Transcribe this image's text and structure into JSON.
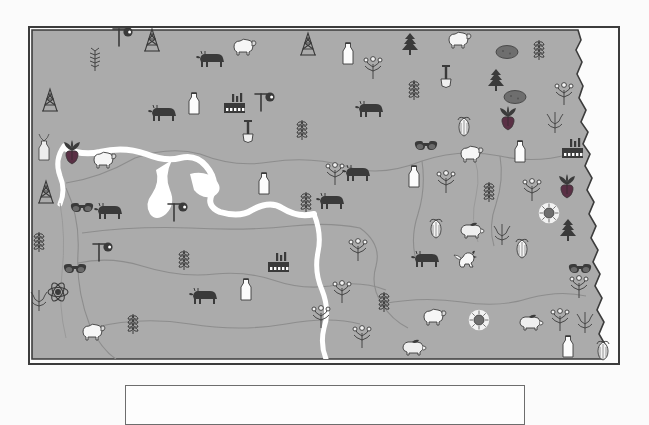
{
  "page": {
    "type": "thematic-pictorial-map",
    "state": "North Dakota"
  },
  "colors": {
    "map_fill": "#ababab",
    "map_border": "#3c3c3c",
    "water": "#ffffff",
    "county_line": "#8d8d8d",
    "legend_border": "#6d6d6d",
    "page_background": "#fbfbfb",
    "icon_dark": "#3a3a3a",
    "icon_mid": "#6e6e6e",
    "icon_light": "#f2f2f2",
    "beet_purple": "#5a3045",
    "sunflower_gold": "#7a7a7a"
  },
  "map": {
    "frame": {
      "x": 28,
      "y": 26,
      "width": 592,
      "height": 339
    },
    "features": [
      {
        "name": "missouri-river",
        "kind": "river",
        "color": "#ffffff"
      },
      {
        "name": "lake-sakakawea",
        "kind": "lake",
        "color": "#ffffff"
      },
      {
        "name": "red-river-border",
        "kind": "river-border",
        "color": "#3c3c3c"
      },
      {
        "name": "county-lines",
        "kind": "boundary",
        "color": "#8d8d8d"
      }
    ]
  },
  "legend": {
    "visible": true,
    "clipped_by_viewport": true,
    "box": {
      "x": 125,
      "y": 385,
      "width": 400,
      "height": 40
    },
    "entries": []
  },
  "symbol_types": [
    {
      "key": "wheat",
      "label": "Wheat",
      "icon": "wheat-icon"
    },
    {
      "key": "cattle",
      "label": "Beef Cattle",
      "icon": "cattle-icon"
    },
    {
      "key": "sheep",
      "label": "Sheep",
      "icon": "sheep-icon"
    },
    {
      "key": "hog",
      "label": "Hogs",
      "icon": "hog-icon"
    },
    {
      "key": "chicken",
      "label": "Poultry",
      "icon": "chicken-icon"
    },
    {
      "key": "milk",
      "label": "Dairy",
      "icon": "milk-bottle-icon"
    },
    {
      "key": "sunflower",
      "label": "Sunflowers",
      "icon": "sunflower-icon"
    },
    {
      "key": "sugarbeet",
      "label": "Sugar Beets",
      "icon": "sugar-beet-icon"
    },
    {
      "key": "potato",
      "label": "Potatoes",
      "icon": "potato-icon"
    },
    {
      "key": "corn",
      "label": "Corn",
      "icon": "corn-icon"
    },
    {
      "key": "barley",
      "label": "Barley",
      "icon": "barley-icon"
    },
    {
      "key": "flax",
      "label": "Flax",
      "icon": "flax-icon"
    },
    {
      "key": "canola",
      "label": "Canola",
      "icon": "canola-icon"
    },
    {
      "key": "conifer",
      "label": "Forestry",
      "icon": "conifer-icon"
    },
    {
      "key": "oilderrick",
      "label": "Petroleum",
      "icon": "oil-derrick-icon"
    },
    {
      "key": "oilpump",
      "label": "Oil Pump",
      "icon": "oil-pump-icon"
    },
    {
      "key": "coal",
      "label": "Lignite Coal",
      "icon": "coal-icon"
    },
    {
      "key": "factory",
      "label": "Manufacturing",
      "icon": "factory-icon"
    },
    {
      "key": "atom",
      "label": "Power Plant",
      "icon": "atom-icon"
    },
    {
      "key": "shovel",
      "label": "Mining",
      "icon": "shovel-icon"
    }
  ],
  "symbols": [
    {
      "t": "oilpump",
      "x": 120,
      "y": 35
    },
    {
      "t": "oilderrick",
      "x": 150,
      "y": 38
    },
    {
      "t": "barley",
      "x": 93,
      "y": 58
    },
    {
      "t": "cattle",
      "x": 210,
      "y": 58
    },
    {
      "t": "sheep",
      "x": 243,
      "y": 45
    },
    {
      "t": "oilderrick",
      "x": 306,
      "y": 42
    },
    {
      "t": "milk",
      "x": 346,
      "y": 52
    },
    {
      "t": "canola",
      "x": 371,
      "y": 66
    },
    {
      "t": "conifer",
      "x": 408,
      "y": 42
    },
    {
      "t": "sheep",
      "x": 458,
      "y": 38
    },
    {
      "t": "potato",
      "x": 505,
      "y": 50
    },
    {
      "t": "wheat",
      "x": 537,
      "y": 48
    },
    {
      "t": "oilderrick",
      "x": 48,
      "y": 98
    },
    {
      "t": "milk",
      "x": 192,
      "y": 102
    },
    {
      "t": "factory",
      "x": 234,
      "y": 103
    },
    {
      "t": "oilpump",
      "x": 262,
      "y": 100
    },
    {
      "t": "cattle",
      "x": 162,
      "y": 112
    },
    {
      "t": "shovel",
      "x": 246,
      "y": 130
    },
    {
      "t": "shovel",
      "x": 444,
      "y": 75
    },
    {
      "t": "conifer",
      "x": 494,
      "y": 78
    },
    {
      "t": "potato",
      "x": 513,
      "y": 95
    },
    {
      "t": "sugarbeet",
      "x": 506,
      "y": 112
    },
    {
      "t": "wheat",
      "x": 412,
      "y": 88
    },
    {
      "t": "cattle",
      "x": 369,
      "y": 108
    },
    {
      "t": "canola",
      "x": 562,
      "y": 92
    },
    {
      "t": "flax",
      "x": 553,
      "y": 120
    },
    {
      "t": "corn",
      "x": 462,
      "y": 126
    },
    {
      "t": "coal",
      "x": 424,
      "y": 145
    },
    {
      "t": "milk",
      "x": 518,
      "y": 150
    },
    {
      "t": "factory",
      "x": 572,
      "y": 148
    },
    {
      "t": "bottlecluster",
      "x": 42,
      "y": 148
    },
    {
      "t": "sugarbeet",
      "x": 70,
      "y": 146
    },
    {
      "t": "sheep",
      "x": 103,
      "y": 158
    },
    {
      "t": "wheat",
      "x": 300,
      "y": 128
    },
    {
      "t": "milk",
      "x": 262,
      "y": 182
    },
    {
      "t": "canola",
      "x": 333,
      "y": 172
    },
    {
      "t": "cattle",
      "x": 356,
      "y": 172
    },
    {
      "t": "sheep",
      "x": 470,
      "y": 152
    },
    {
      "t": "milk",
      "x": 412,
      "y": 175
    },
    {
      "t": "canola",
      "x": 444,
      "y": 180
    },
    {
      "t": "wheat",
      "x": 487,
      "y": 190
    },
    {
      "t": "canola",
      "x": 530,
      "y": 188
    },
    {
      "t": "sugarbeet",
      "x": 565,
      "y": 180
    },
    {
      "t": "oilderrick",
      "x": 44,
      "y": 190
    },
    {
      "t": "coal",
      "x": 80,
      "y": 207
    },
    {
      "t": "cattle",
      "x": 108,
      "y": 210
    },
    {
      "t": "oilpump",
      "x": 175,
      "y": 210
    },
    {
      "t": "wheat",
      "x": 304,
      "y": 200
    },
    {
      "t": "cattle",
      "x": 330,
      "y": 200
    },
    {
      "t": "corn",
      "x": 434,
      "y": 228
    },
    {
      "t": "hog",
      "x": 470,
      "y": 228
    },
    {
      "t": "flax",
      "x": 500,
      "y": 232
    },
    {
      "t": "sunflower",
      "x": 547,
      "y": 211
    },
    {
      "t": "conifer",
      "x": 566,
      "y": 228
    },
    {
      "t": "wheat",
      "x": 37,
      "y": 240
    },
    {
      "t": "oilpump",
      "x": 100,
      "y": 250
    },
    {
      "t": "coal",
      "x": 73,
      "y": 268
    },
    {
      "t": "wheat",
      "x": 182,
      "y": 258
    },
    {
      "t": "factory",
      "x": 278,
      "y": 262
    },
    {
      "t": "canola",
      "x": 356,
      "y": 248
    },
    {
      "t": "cattle",
      "x": 425,
      "y": 258
    },
    {
      "t": "chicken",
      "x": 466,
      "y": 258
    },
    {
      "t": "corn",
      "x": 520,
      "y": 248
    },
    {
      "t": "coal",
      "x": 578,
      "y": 268
    },
    {
      "t": "atom",
      "x": 56,
      "y": 290
    },
    {
      "t": "cattle",
      "x": 203,
      "y": 295
    },
    {
      "t": "milk",
      "x": 244,
      "y": 288
    },
    {
      "t": "canola",
      "x": 340,
      "y": 290
    },
    {
      "t": "wheat",
      "x": 382,
      "y": 300
    },
    {
      "t": "sheep",
      "x": 433,
      "y": 315
    },
    {
      "t": "sunflower",
      "x": 477,
      "y": 318
    },
    {
      "t": "hog",
      "x": 529,
      "y": 320
    },
    {
      "t": "canola",
      "x": 558,
      "y": 318
    },
    {
      "t": "flax",
      "x": 583,
      "y": 320
    },
    {
      "t": "canola",
      "x": 577,
      "y": 285
    },
    {
      "t": "sheep",
      "x": 92,
      "y": 330
    },
    {
      "t": "wheat",
      "x": 131,
      "y": 322
    },
    {
      "t": "canola",
      "x": 360,
      "y": 335
    },
    {
      "t": "hog",
      "x": 412,
      "y": 345
    },
    {
      "t": "milk",
      "x": 566,
      "y": 345
    },
    {
      "t": "corn",
      "x": 601,
      "y": 350
    },
    {
      "t": "flax",
      "x": 37,
      "y": 298
    },
    {
      "t": "canola",
      "x": 319,
      "y": 315
    }
  ]
}
